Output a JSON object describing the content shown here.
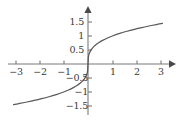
{
  "chart_data": {
    "type": "line",
    "title": "",
    "subtitle": "",
    "xlabel": "",
    "ylabel": "",
    "function": "y = cube root of x",
    "xlim": [
      -3.35,
      3.35
    ],
    "ylim": [
      -1.72,
      1.72
    ],
    "xticks": [
      -3,
      -2,
      -1,
      1,
      2,
      3
    ],
    "yticks": [
      1.5,
      1,
      0.5,
      -0.5,
      -1,
      -1.5
    ],
    "xtick_labels": [
      "−3",
      "−2",
      "−1",
      "1",
      "2",
      "3"
    ],
    "ytick_labels": [
      "1.5",
      "1",
      "0.5",
      "−0.5",
      "−1",
      "−1.5"
    ],
    "grid": false,
    "legend": null,
    "axis_arrows": [
      "right",
      "up"
    ],
    "x": [
      -3.05,
      -2.8,
      -2.5,
      -2.2,
      -1.9,
      -1.6,
      -1.3,
      -1.0,
      -0.8,
      -0.6,
      -0.45,
      -0.3,
      -0.2,
      -0.12,
      -0.06,
      -0.02,
      0,
      0.02,
      0.06,
      0.12,
      0.2,
      0.3,
      0.45,
      0.6,
      0.8,
      1.0,
      1.3,
      1.6,
      1.9,
      2.2,
      2.5,
      2.8,
      3.05
    ],
    "y": [
      -1.449,
      -1.409,
      -1.357,
      -1.301,
      -1.239,
      -1.17,
      -1.091,
      -1.0,
      -0.928,
      -0.843,
      -0.766,
      -0.669,
      -0.585,
      -0.493,
      -0.391,
      -0.271,
      0,
      0.271,
      0.391,
      0.493,
      0.585,
      0.669,
      0.766,
      0.843,
      0.928,
      1.0,
      1.091,
      1.17,
      1.239,
      1.301,
      1.357,
      1.409,
      1.449
    ],
    "series": [
      {
        "name": "cube-root-curve",
        "color": "#595959",
        "x": [
          -3.05,
          -2.8,
          -2.5,
          -2.2,
          -1.9,
          -1.6,
          -1.3,
          -1.0,
          -0.8,
          -0.6,
          -0.45,
          -0.3,
          -0.2,
          -0.12,
          -0.06,
          -0.02,
          0,
          0.02,
          0.06,
          0.12,
          0.2,
          0.3,
          0.45,
          0.6,
          0.8,
          1.0,
          1.3,
          1.6,
          1.9,
          2.2,
          2.5,
          2.8,
          3.05
        ],
        "y": [
          -1.449,
          -1.409,
          -1.357,
          -1.301,
          -1.239,
          -1.17,
          -1.091,
          -1.0,
          -0.928,
          -0.843,
          -0.766,
          -0.669,
          -0.585,
          -0.493,
          -0.391,
          -0.271,
          0,
          0.271,
          0.391,
          0.493,
          0.585,
          0.669,
          0.766,
          0.843,
          0.928,
          1.0,
          1.091,
          1.17,
          1.239,
          1.301,
          1.357,
          1.409,
          1.449
        ]
      }
    ],
    "colors": {
      "curve": "#595959",
      "axis": "#7a7a7a",
      "tick": "#7a7a7a",
      "label": "#3a3a3a",
      "background": "#ffffff"
    }
  },
  "labels": {
    "x": [
      {
        "text": "−3",
        "value": -3,
        "px": 16,
        "py": 72
      },
      {
        "text": "−2",
        "value": -2,
        "px": 40,
        "py": 72
      },
      {
        "text": "−1",
        "value": -1,
        "px": 64,
        "py": 72
      },
      {
        "text": "1",
        "value": 1,
        "px": 113,
        "py": 72
      },
      {
        "text": "2",
        "value": 2,
        "px": 137,
        "py": 72
      },
      {
        "text": "3",
        "value": 3,
        "px": 161,
        "py": 72
      }
    ],
    "y": [
      {
        "text": "1.5",
        "value": 1.5,
        "px": 81,
        "py": 17
      },
      {
        "text": "1",
        "value": 1,
        "px": 81,
        "py": 31
      },
      {
        "text": "0.5",
        "value": 0.5,
        "px": 81,
        "py": 45
      },
      {
        "text": "−0.5",
        "value": -0.5,
        "px": 84,
        "py": 73
      },
      {
        "text": "−1",
        "value": -1,
        "px": 84,
        "py": 87
      },
      {
        "text": "−1.5",
        "value": -1.5,
        "px": 84,
        "py": 101
      }
    ]
  }
}
